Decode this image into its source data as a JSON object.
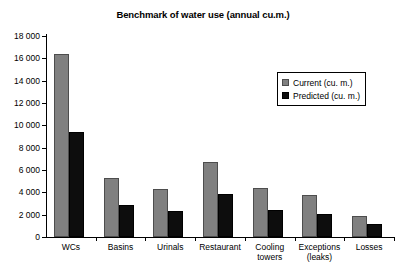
{
  "chart_data": {
    "type": "bar",
    "title": "Benchmark of water use (annual cu.m.)",
    "xlabel": "",
    "ylabel": "",
    "ylim": [
      0,
      18000
    ],
    "ytick_step": 2000,
    "ytick_labels": [
      "18 000",
      "16 000",
      "14 000",
      "12 000",
      "10 000",
      "8 000",
      "6 000",
      "4 000",
      "2 000",
      "0"
    ],
    "grid": false,
    "legend_position": "upper-right-inside",
    "categories": [
      "WCs",
      "Basins",
      "Urinals",
      "Restaurant",
      "Cooling\ntowers",
      "Exceptions\n(leaks)",
      "Losses"
    ],
    "series": [
      {
        "name": "Current (cu. m.)",
        "color": "#808080",
        "values": [
          16400,
          5300,
          4300,
          6700,
          4350,
          3750,
          1900
        ]
      },
      {
        "name": "Predicted (cu. m.)",
        "color": "#0d0d0d",
        "values": [
          9400,
          2900,
          2300,
          3850,
          2400,
          2050,
          1200
        ]
      }
    ]
  },
  "legend": {
    "items": [
      {
        "label": "Current (cu. m.)"
      },
      {
        "label": "Predicted (cu. m.)"
      }
    ]
  }
}
